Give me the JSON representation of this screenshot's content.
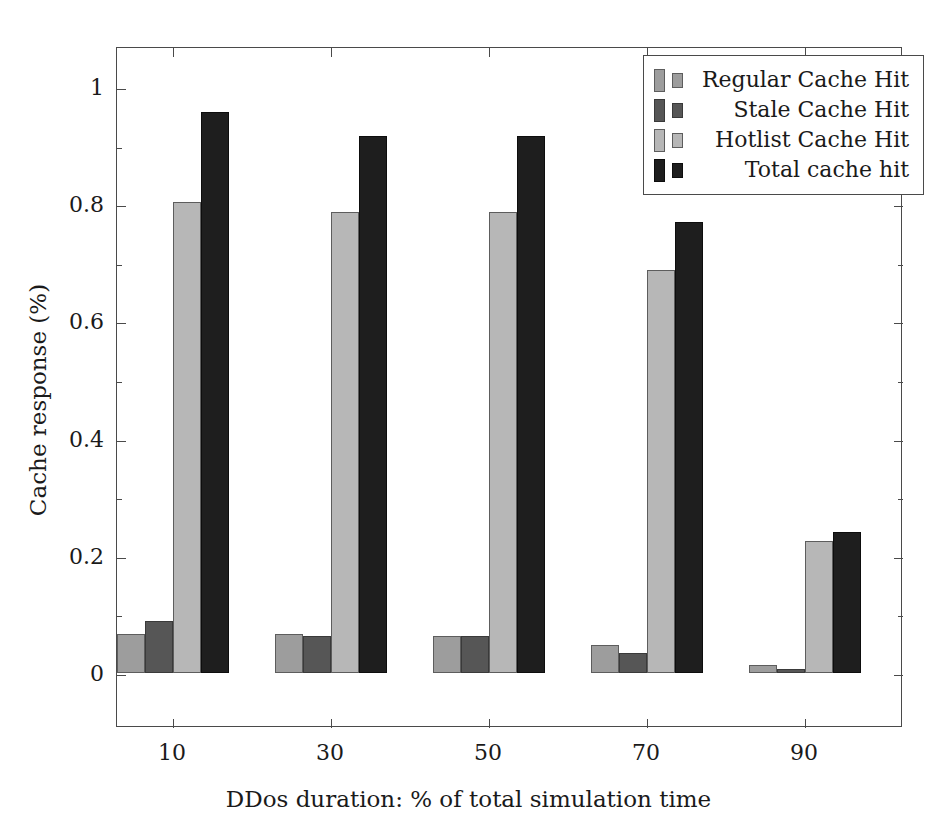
{
  "chart_data": {
    "type": "bar",
    "title": "",
    "xlabel": "DDos duration: % of total simulation time",
    "ylabel": "Cache response (%)",
    "categories": [
      "10",
      "30",
      "50",
      "70",
      "90"
    ],
    "series": [
      {
        "name": "Regular Cache Hit",
        "color": "#9d9d9d",
        "values": [
          0.066,
          0.067,
          0.064,
          0.047,
          0.013
        ]
      },
      {
        "name": "Stale Cache Hit",
        "color": "#565656",
        "values": [
          0.089,
          0.063,
          0.063,
          0.035,
          0.006
        ]
      },
      {
        "name": "Hotlist Cache Hit",
        "color": "#b7b7b7",
        "values": [
          0.803,
          0.786,
          0.787,
          0.688,
          0.225
        ]
      },
      {
        "name": "Total cache hit",
        "color": "#1e1e1e",
        "values": [
          0.957,
          0.917,
          0.917,
          0.77,
          0.241
        ]
      }
    ],
    "ylim": [
      0,
      1.07
    ],
    "yticks": [
      "0",
      "0.2",
      "0.4",
      "0.6",
      "0.8",
      "1"
    ],
    "ytick_values": [
      0,
      0.2,
      0.4,
      0.6,
      0.8,
      1.0
    ],
    "yminor_values": [
      0.1,
      0.3,
      0.5,
      0.7,
      0.9
    ],
    "xticks": [
      "10",
      "30",
      "50",
      "70",
      "90"
    ],
    "grid": false,
    "legend_position": "top-right",
    "legend_entries": [
      "Regular Cache Hit",
      "Stale Cache Hit",
      "Hotlist Cache Hit",
      "Total cache hit"
    ]
  },
  "axes": {
    "ylabel": "Cache response (%)",
    "xlabel": "DDos duration: % of total simulation time"
  },
  "legend": {
    "entries": [
      {
        "label": "Regular Cache Hit"
      },
      {
        "label": "Stale Cache Hit"
      },
      {
        "label": "Hotlist Cache Hit"
      },
      {
        "label": "Total cache hit"
      }
    ]
  }
}
